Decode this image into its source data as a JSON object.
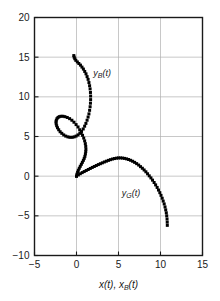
{
  "chart_data": {
    "type": "scatter",
    "title": "",
    "subtitle": "",
    "xlabel": "x(t), xB(t)",
    "xlabel_parts": {
      "main1": "x(t), x",
      "sub": "B",
      "main2": "(t)"
    },
    "ylabel": "",
    "xlim": [
      -5,
      15
    ],
    "ylim": [
      -10,
      20
    ],
    "xticks": [
      -5,
      0,
      5,
      10,
      15
    ],
    "xticklabels": [
      "−5",
      "0",
      "5",
      "10",
      "15"
    ],
    "yticks": [
      -10,
      -5,
      0,
      5,
      10,
      15,
      20
    ],
    "yticklabels": [
      "−10",
      "−5",
      "0",
      "5",
      "10",
      "15",
      "20"
    ],
    "grid": true,
    "grid_color": "#b0b0b0",
    "axis_color": "#1a1a1a",
    "marker": "filled-square",
    "marker_size": 3,
    "legend_position": "inline-annotation",
    "series": [
      {
        "name": "yB(t)",
        "label_parts": {
          "main1": "y",
          "sub": "B",
          "main2": "(t)"
        },
        "color": "#000000",
        "annotation_x": 2.0,
        "annotation_y": 12.6,
        "points": [
          [
            0.0,
            0.0
          ],
          [
            0.05,
            0.25
          ],
          [
            0.13,
            0.5
          ],
          [
            0.22,
            0.75
          ],
          [
            0.33,
            1.0
          ],
          [
            0.45,
            1.25
          ],
          [
            0.58,
            1.5
          ],
          [
            0.7,
            1.75
          ],
          [
            0.82,
            2.0
          ],
          [
            0.92,
            2.25
          ],
          [
            1.0,
            2.5
          ],
          [
            1.06,
            2.8
          ],
          [
            1.1,
            3.1
          ],
          [
            1.12,
            3.4
          ],
          [
            1.1,
            3.75
          ],
          [
            1.05,
            4.1
          ],
          [
            0.97,
            4.45
          ],
          [
            0.86,
            4.8
          ],
          [
            0.72,
            5.15
          ],
          [
            0.56,
            5.5
          ],
          [
            0.38,
            5.85
          ],
          [
            0.18,
            6.2
          ],
          [
            -0.05,
            6.5
          ],
          [
            -0.3,
            6.8
          ],
          [
            -0.55,
            7.05
          ],
          [
            -0.82,
            7.25
          ],
          [
            -1.1,
            7.4
          ],
          [
            -1.38,
            7.5
          ],
          [
            -1.62,
            7.55
          ],
          [
            -1.85,
            7.55
          ],
          [
            -2.05,
            7.5
          ],
          [
            -2.2,
            7.4
          ],
          [
            -2.32,
            7.25
          ],
          [
            -2.4,
            7.05
          ],
          [
            -2.44,
            6.85
          ],
          [
            -2.42,
            6.6
          ],
          [
            -2.36,
            6.35
          ],
          [
            -2.26,
            6.1
          ],
          [
            -2.12,
            5.85
          ],
          [
            -1.95,
            5.6
          ],
          [
            -1.75,
            5.4
          ],
          [
            -1.52,
            5.2
          ],
          [
            -1.28,
            5.05
          ],
          [
            -1.02,
            4.95
          ],
          [
            -0.78,
            4.9
          ],
          [
            -0.52,
            4.9
          ],
          [
            -0.28,
            4.95
          ],
          [
            -0.05,
            5.05
          ],
          [
            0.18,
            5.2
          ],
          [
            0.4,
            5.4
          ],
          [
            0.6,
            5.65
          ],
          [
            0.8,
            5.95
          ],
          [
            0.97,
            6.3
          ],
          [
            1.12,
            6.65
          ],
          [
            1.26,
            7.05
          ],
          [
            1.38,
            7.45
          ],
          [
            1.48,
            7.85
          ],
          [
            1.56,
            8.3
          ],
          [
            1.62,
            8.75
          ],
          [
            1.66,
            9.2
          ],
          [
            1.68,
            9.65
          ],
          [
            1.68,
            10.1
          ],
          [
            1.66,
            10.55
          ],
          [
            1.62,
            11.0
          ],
          [
            1.56,
            11.4
          ],
          [
            1.48,
            11.8
          ],
          [
            1.38,
            12.2
          ],
          [
            1.26,
            12.55
          ],
          [
            1.13,
            12.9
          ],
          [
            0.98,
            13.2
          ],
          [
            0.82,
            13.5
          ],
          [
            0.65,
            13.75
          ],
          [
            0.47,
            14.0
          ],
          [
            0.28,
            14.2
          ],
          [
            0.1,
            14.4
          ],
          [
            -0.08,
            14.6
          ],
          [
            -0.2,
            14.8
          ],
          [
            -0.28,
            15.0
          ],
          [
            -0.32,
            15.2
          ]
        ]
      },
      {
        "name": "yG(t)",
        "label_parts": {
          "main1": "y",
          "sub": "G",
          "main2": "(t)"
        },
        "color": "#000000",
        "annotation_x": 5.4,
        "annotation_y": -2.5,
        "points": [
          [
            0.0,
            0.0
          ],
          [
            0.22,
            0.16
          ],
          [
            0.45,
            0.31
          ],
          [
            0.68,
            0.45
          ],
          [
            0.92,
            0.58
          ],
          [
            1.16,
            0.71
          ],
          [
            1.4,
            0.84
          ],
          [
            1.64,
            0.97
          ],
          [
            1.88,
            1.1
          ],
          [
            2.12,
            1.22
          ],
          [
            2.36,
            1.34
          ],
          [
            2.6,
            1.46
          ],
          [
            2.84,
            1.57
          ],
          [
            3.08,
            1.68
          ],
          [
            3.32,
            1.79
          ],
          [
            3.56,
            1.89
          ],
          [
            3.8,
            1.99
          ],
          [
            4.04,
            2.08
          ],
          [
            4.28,
            2.16
          ],
          [
            4.52,
            2.22
          ],
          [
            4.76,
            2.27
          ],
          [
            5.0,
            2.3
          ],
          [
            5.24,
            2.3
          ],
          [
            5.48,
            2.28
          ],
          [
            5.72,
            2.24
          ],
          [
            5.96,
            2.18
          ],
          [
            6.2,
            2.1
          ],
          [
            6.44,
            2.0
          ],
          [
            6.68,
            1.88
          ],
          [
            6.92,
            1.74
          ],
          [
            7.16,
            1.58
          ],
          [
            7.4,
            1.4
          ],
          [
            7.62,
            1.2
          ],
          [
            7.84,
            1.0
          ],
          [
            8.05,
            0.78
          ],
          [
            8.26,
            0.55
          ],
          [
            8.46,
            0.3
          ],
          [
            8.66,
            0.04
          ],
          [
            8.86,
            -0.22
          ],
          [
            9.05,
            -0.5
          ],
          [
            9.24,
            -0.8
          ],
          [
            9.42,
            -1.1
          ],
          [
            9.6,
            -1.42
          ],
          [
            9.76,
            -1.75
          ],
          [
            9.92,
            -2.08
          ],
          [
            10.06,
            -2.42
          ],
          [
            10.2,
            -2.78
          ],
          [
            10.32,
            -3.14
          ],
          [
            10.44,
            -3.5
          ],
          [
            10.54,
            -3.88
          ],
          [
            10.62,
            -4.25
          ],
          [
            10.69,
            -4.62
          ],
          [
            10.74,
            -5.0
          ],
          [
            10.78,
            -5.4
          ],
          [
            10.8,
            -5.8
          ],
          [
            10.81,
            -6.2
          ]
        ]
      }
    ]
  }
}
